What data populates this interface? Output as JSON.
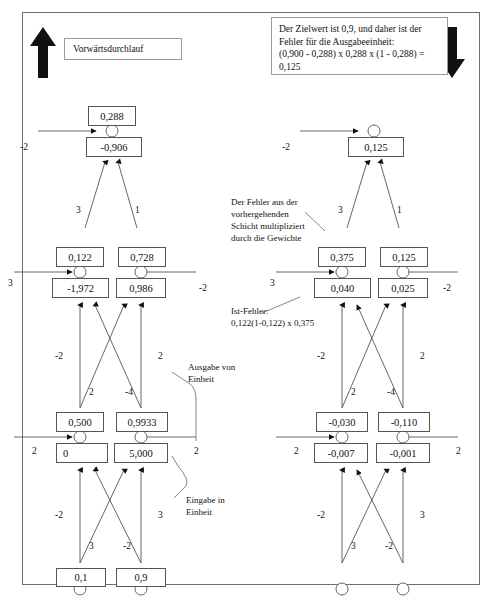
{
  "figure": {
    "title_box": {
      "label": "Vorwärtsdurchlauf"
    },
    "arrows": {
      "up_icon": "arrow-up-icon",
      "down_icon": "arrow-down-icon"
    },
    "notes": {
      "target_error": "Der Zielwert ist 0,9, und daher ist der Fehler für die Ausgabeeinheit:\n(0,900 - 0,288) x 0,288 x (1 - 0,288) = 0,125",
      "backprop_weights": "Der Fehler aus der\nvorhergehenden\nSchicht multipliziert\ndurch die Gewichte",
      "actual_error": "Ist-Fehler:\n0,122(1-0,122) x 0,375",
      "output_of_unit": "Ausgabe von\nEinheit",
      "input_to_unit": "Eingabe in\nEinheit"
    }
  },
  "left_network": {
    "name": "forward-pass-network",
    "layers": {
      "output": {
        "nodes": [
          {
            "out": "0,288",
            "in": "-0,906"
          }
        ],
        "side_weight_left": "-2"
      },
      "hidden": {
        "nodes": [
          {
            "out": "0,122",
            "in": "-1,972"
          },
          {
            "out": "0,728",
            "in": "0,986"
          }
        ],
        "side_weight_left": "3",
        "side_weight_right": "-2",
        "edge_weights": [
          "3",
          "1"
        ]
      },
      "input": {
        "nodes": [
          {
            "out": "0,500",
            "in": "0"
          },
          {
            "out": "0,9933",
            "in": "5,000"
          }
        ],
        "side_weight_left": "2",
        "side_weight_right": "2",
        "edge_weights": [
          "-2",
          "2",
          "-4",
          "2"
        ]
      },
      "source": {
        "nodes": [
          {
            "value": "0,1"
          },
          {
            "value": "0,9"
          }
        ],
        "edge_weights": [
          "-2",
          "3",
          "-2",
          "3"
        ]
      }
    }
  },
  "right_network": {
    "name": "backward-pass-network",
    "layers": {
      "output": {
        "nodes": [
          {
            "in": "0,125"
          }
        ],
        "side_weight_left": "-2"
      },
      "hidden": {
        "nodes": [
          {
            "out": "0,375",
            "in": "0,040"
          },
          {
            "out": "0,125",
            "in": "0,025"
          }
        ],
        "side_weight_left": "3",
        "side_weight_right": "-2",
        "edge_weights": [
          "3",
          "1"
        ]
      },
      "input": {
        "nodes": [
          {
            "out": "-0,030",
            "in": "-0,007"
          },
          {
            "out": "-0,110",
            "in": "-0,001"
          }
        ],
        "side_weight_left": "2",
        "side_weight_right": "2",
        "edge_weights": [
          "-2",
          "2",
          "-4",
          "2"
        ]
      },
      "source": {
        "nodes": [
          {
            "value": ""
          },
          {
            "value": ""
          }
        ],
        "edge_weights": [
          "-2",
          "3",
          "-2",
          "3"
        ]
      }
    }
  },
  "colors": {
    "line": "#555555",
    "box_border": "#555555",
    "frame": "#6f6f6f",
    "text": "#111111"
  }
}
